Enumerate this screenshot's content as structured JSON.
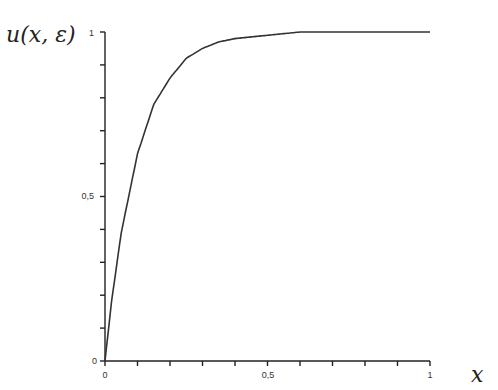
{
  "chart_data": {
    "type": "line",
    "title": "",
    "xlabel": "x",
    "ylabel": "u(x, ε)",
    "xlim": [
      0,
      1
    ],
    "ylim": [
      0,
      1
    ],
    "grid": false,
    "legend": null,
    "x_ticks": {
      "major_labels": [
        "0",
        "0,5",
        "1"
      ],
      "major_values": [
        0,
        0.5,
        1
      ],
      "minor_step": 0.1
    },
    "y_ticks": {
      "major_labels": [
        "0",
        "0,5",
        "1"
      ],
      "major_values": [
        0,
        0.5,
        1
      ],
      "minor_step": 0.1
    },
    "series": [
      {
        "name": "u(x, ε)",
        "x": [
          0,
          0.02,
          0.05,
          0.1,
          0.15,
          0.2,
          0.25,
          0.3,
          0.35,
          0.4,
          0.5,
          0.6,
          0.7,
          0.8,
          0.9,
          1.0
        ],
        "values": [
          0,
          0.18,
          0.39,
          0.63,
          0.78,
          0.86,
          0.92,
          0.95,
          0.97,
          0.98,
          0.99,
          1.0,
          1.0,
          1.0,
          1.0,
          1.0
        ]
      }
    ]
  },
  "labels": {
    "y_axis": "u(x, ε)",
    "x_axis": "x",
    "y_tick_0": "0",
    "y_tick_half": "0,5",
    "y_tick_1": "1",
    "x_tick_0": "0",
    "x_tick_half": "0,5",
    "x_tick_1": "1"
  }
}
